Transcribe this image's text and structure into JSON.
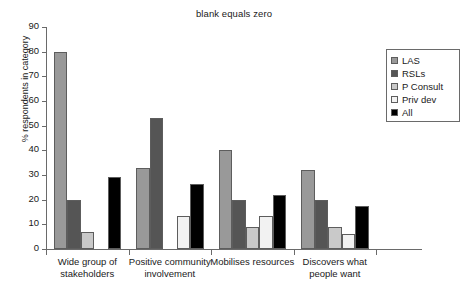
{
  "chart_data": {
    "type": "bar",
    "title": "blank equals zero",
    "xlabel": "",
    "ylabel": "% respondents in category",
    "ylim": [
      0,
      90
    ],
    "yticks": [
      0,
      10,
      20,
      30,
      40,
      50,
      60,
      70,
      80,
      90
    ],
    "grid": false,
    "legend_position": "top-right",
    "categories": [
      "Wide group of stakeholders",
      "Positive community involvement",
      "Mobilises resources",
      "Discovers what people want"
    ],
    "category_lines": [
      [
        "Wide group of",
        "stakeholders"
      ],
      [
        "Positive community",
        "involvement"
      ],
      [
        "Mobilises resources"
      ],
      [
        "Discovers what",
        "people want"
      ]
    ],
    "series": [
      {
        "name": "LAS",
        "color": "#999999",
        "values": [
          80,
          33,
          40,
          32
        ]
      },
      {
        "name": "RSLs",
        "color": "#555555",
        "values": [
          20,
          53,
          20,
          20
        ]
      },
      {
        "name": "P Consult",
        "color": "#c9c9c9",
        "values": [
          7,
          0,
          9,
          9
        ]
      },
      {
        "name": "Priv dev",
        "color": "#f2f2f2",
        "values": [
          0,
          13.5,
          13.5,
          6
        ]
      },
      {
        "name": "All",
        "color": "#000000",
        "values": [
          29,
          26.5,
          22,
          17.5
        ]
      }
    ]
  }
}
